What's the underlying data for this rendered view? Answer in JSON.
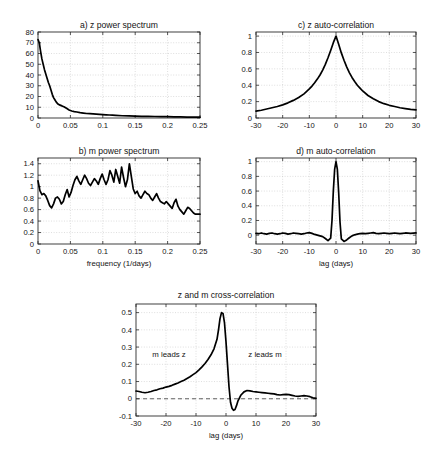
{
  "figure": {
    "panels": [
      "a",
      "b",
      "c",
      "d",
      "e"
    ]
  },
  "chart_data": [
    {
      "id": "a",
      "type": "line",
      "title": "a) z power spectrum",
      "xlabel": "",
      "ylabel": "",
      "xlim": [
        0,
        0.25
      ],
      "ylim": [
        0,
        80
      ],
      "xticks": [
        0,
        0.05,
        0.1,
        0.15,
        0.2,
        0.25
      ],
      "xticklabels": [
        "0",
        "0.05",
        "0.1",
        "0.15",
        "0.2",
        "0.25"
      ],
      "yticks": [
        0,
        10,
        20,
        30,
        40,
        50,
        60,
        70,
        80
      ],
      "yticklabels": [
        "0",
        "10",
        "20",
        "30",
        "40",
        "50",
        "60",
        "70",
        "80"
      ],
      "grid": true,
      "x": [
        0,
        0.002,
        0.004,
        0.006,
        0.008,
        0.01,
        0.012,
        0.014,
        0.016,
        0.018,
        0.02,
        0.022,
        0.024,
        0.026,
        0.028,
        0.03,
        0.032,
        0.034,
        0.036,
        0.038,
        0.04,
        0.044,
        0.048,
        0.052,
        0.056,
        0.06,
        0.065,
        0.07,
        0.075,
        0.08,
        0.085,
        0.09,
        0.095,
        0.1,
        0.105,
        0.11,
        0.115,
        0.12,
        0.13,
        0.14,
        0.15,
        0.16,
        0.17,
        0.18,
        0.19,
        0.2,
        0.21,
        0.22,
        0.23,
        0.24,
        0.25
      ],
      "y": [
        73,
        70,
        62,
        55,
        50,
        45,
        41,
        37,
        33,
        30,
        26,
        22,
        19,
        17,
        15,
        13.5,
        12.5,
        12,
        11.5,
        11,
        10.5,
        9,
        7.5,
        6.5,
        6,
        5.6,
        5,
        4.6,
        4.2,
        4.0,
        3.8,
        3.6,
        3.4,
        3.2,
        3.0,
        2.8,
        2.6,
        2.4,
        2.1,
        1.9,
        1.7,
        1.6,
        1.5,
        1.4,
        1.3,
        1.2,
        1.1,
        1.0,
        0.9,
        0.85,
        0.8
      ]
    },
    {
      "id": "b",
      "type": "line",
      "title": "b) m power spectrum",
      "xlabel": "frequency (1/days)",
      "ylabel": "",
      "xlim": [
        0,
        0.25
      ],
      "ylim": [
        0,
        1.5
      ],
      "xticks": [
        0,
        0.05,
        0.1,
        0.15,
        0.2,
        0.25
      ],
      "xticklabels": [
        "0",
        "0.05",
        "0.1",
        "0.15",
        "0.2",
        "0.25"
      ],
      "yticks": [
        0,
        0.2,
        0.4,
        0.6,
        0.8,
        1.0,
        1.2,
        1.4
      ],
      "yticklabels": [
        "0",
        "0.2",
        "0.4",
        "0.6",
        "0.8",
        "1",
        "1.2",
        "1.4"
      ],
      "grid": true,
      "x": [
        0,
        0.003,
        0.006,
        0.009,
        0.012,
        0.015,
        0.018,
        0.021,
        0.024,
        0.027,
        0.03,
        0.033,
        0.036,
        0.039,
        0.042,
        0.045,
        0.048,
        0.051,
        0.054,
        0.057,
        0.06,
        0.063,
        0.066,
        0.069,
        0.072,
        0.075,
        0.078,
        0.081,
        0.084,
        0.087,
        0.09,
        0.093,
        0.096,
        0.099,
        0.102,
        0.105,
        0.108,
        0.111,
        0.114,
        0.117,
        0.12,
        0.123,
        0.126,
        0.129,
        0.132,
        0.135,
        0.138,
        0.141,
        0.144,
        0.147,
        0.15,
        0.153,
        0.156,
        0.159,
        0.162,
        0.165,
        0.168,
        0.171,
        0.174,
        0.177,
        0.18,
        0.183,
        0.186,
        0.189,
        0.192,
        0.195,
        0.198,
        0.201,
        0.204,
        0.207,
        0.21,
        0.213,
        0.216,
        0.219,
        0.222,
        0.225,
        0.228,
        0.231,
        0.234,
        0.237,
        0.24,
        0.243,
        0.246,
        0.25
      ],
      "y": [
        1.1,
        0.93,
        0.86,
        0.88,
        0.84,
        0.76,
        0.67,
        0.63,
        0.7,
        0.8,
        0.82,
        0.78,
        0.7,
        0.74,
        0.86,
        0.95,
        0.82,
        0.9,
        1.02,
        1.12,
        1.18,
        1.1,
        1.04,
        1.12,
        1.2,
        1.14,
        1.06,
        1.02,
        1.08,
        1.14,
        1.1,
        1.04,
        1.14,
        1.22,
        1.12,
        1.04,
        1.12,
        1.28,
        1.2,
        1.08,
        1.3,
        1.18,
        1.06,
        1.34,
        1.16,
        1.0,
        1.12,
        1.4,
        1.18,
        0.96,
        0.88,
        0.92,
        0.84,
        0.8,
        0.86,
        0.92,
        0.88,
        0.86,
        0.8,
        0.76,
        0.82,
        0.88,
        0.8,
        0.74,
        0.72,
        0.7,
        0.74,
        0.7,
        0.66,
        0.62,
        0.72,
        0.78,
        0.66,
        0.6,
        0.56,
        0.52,
        0.58,
        0.64,
        0.62,
        0.58,
        0.54,
        0.52,
        0.52,
        0.52
      ]
    },
    {
      "id": "c",
      "type": "line",
      "title": "c) z auto-correlation",
      "xlabel": "",
      "ylabel": "",
      "xlim": [
        -30,
        30
      ],
      "ylim": [
        0,
        1.05
      ],
      "xticks": [
        -30,
        -20,
        -10,
        0,
        10,
        20,
        30
      ],
      "xticklabels": [
        "-30",
        "-20",
        "-10",
        "0",
        "10",
        "20",
        "30"
      ],
      "yticks": [
        0,
        0.2,
        0.4,
        0.6,
        0.8,
        1.0
      ],
      "yticklabels": [
        "0",
        "0.2",
        "0.4",
        "0.6",
        "0.8",
        "1"
      ],
      "grid": true,
      "x": [
        -30,
        -28,
        -26,
        -24,
        -22,
        -20,
        -18,
        -16,
        -14,
        -12,
        -10,
        -9,
        -8,
        -7,
        -6,
        -5,
        -4,
        -3,
        -2,
        -1,
        0,
        1,
        2,
        3,
        4,
        5,
        6,
        7,
        8,
        9,
        10,
        12,
        14,
        16,
        18,
        20,
        22,
        24,
        26,
        28,
        30
      ],
      "y": [
        0.085,
        0.095,
        0.11,
        0.125,
        0.14,
        0.16,
        0.185,
        0.215,
        0.25,
        0.295,
        0.355,
        0.39,
        0.43,
        0.475,
        0.525,
        0.585,
        0.655,
        0.735,
        0.825,
        0.92,
        1.0,
        0.9,
        0.795,
        0.705,
        0.625,
        0.555,
        0.495,
        0.445,
        0.4,
        0.365,
        0.33,
        0.275,
        0.235,
        0.2,
        0.175,
        0.155,
        0.14,
        0.125,
        0.115,
        0.105,
        0.1
      ]
    },
    {
      "id": "d",
      "type": "line",
      "title": "d) m auto-correlation",
      "xlabel": "lag (days)",
      "ylabel": "",
      "xlim": [
        -30,
        30
      ],
      "ylim": [
        -0.12,
        1.05
      ],
      "xticks": [
        -30,
        -20,
        -10,
        0,
        10,
        20,
        30
      ],
      "xticklabels": [
        "-30",
        "-20",
        "-10",
        "0",
        "10",
        "20",
        "30"
      ],
      "yticks": [
        0,
        0.2,
        0.4,
        0.6,
        0.8,
        1.0
      ],
      "yticklabels": [
        "0",
        "0.2",
        "0.4",
        "0.6",
        "0.8",
        "1"
      ],
      "grid": true,
      "x": [
        -30,
        -29,
        -28,
        -27,
        -26,
        -25,
        -24,
        -23,
        -22,
        -21,
        -20,
        -19,
        -18,
        -17,
        -16,
        -15,
        -14,
        -13,
        -12,
        -11,
        -10,
        -9,
        -8,
        -7,
        -6,
        -5,
        -4,
        -3,
        -2,
        -1.5,
        -1,
        -0.5,
        0,
        0.5,
        1,
        1.5,
        2,
        3,
        4,
        5,
        6,
        7,
        8,
        9,
        10,
        11,
        12,
        13,
        14,
        15,
        16,
        17,
        18,
        19,
        20,
        21,
        22,
        23,
        24,
        25,
        26,
        27,
        28,
        29,
        30
      ],
      "y": [
        0.025,
        0.02,
        0.03,
        0.02,
        0.015,
        0.025,
        0.03,
        0.02,
        0.015,
        0.02,
        0.03,
        0.025,
        0.015,
        0.02,
        0.03,
        0.025,
        0.02,
        0.015,
        0.02,
        0.03,
        0.035,
        0.025,
        0.01,
        0.0,
        -0.01,
        -0.02,
        -0.045,
        -0.075,
        -0.04,
        0.2,
        0.6,
        0.9,
        1.0,
        0.9,
        0.58,
        0.18,
        -0.05,
        -0.085,
        -0.065,
        -0.035,
        -0.01,
        0.005,
        0.015,
        0.02,
        0.025,
        0.02,
        0.025,
        0.03,
        0.035,
        0.025,
        0.02,
        0.025,
        0.03,
        0.025,
        0.02,
        0.025,
        0.03,
        0.025,
        0.02,
        0.025,
        0.03,
        0.028,
        0.025,
        0.028,
        0.03
      ]
    },
    {
      "id": "e",
      "type": "line",
      "title": "z and m cross-correlation",
      "xlabel": "lag (days)",
      "ylabel": "",
      "xlim": [
        -30,
        30
      ],
      "ylim": [
        -0.1,
        0.55
      ],
      "xticks": [
        -30,
        -20,
        -10,
        0,
        10,
        20,
        30
      ],
      "xticklabels": [
        "-30",
        "-20",
        "-10",
        "0",
        "10",
        "20",
        "30"
      ],
      "yticks": [
        -0.1,
        0,
        0.1,
        0.2,
        0.3,
        0.4,
        0.5
      ],
      "yticklabels": [
        "-0.1",
        "0",
        "0.1",
        "0.2",
        "0.3",
        "0.4",
        "0.5"
      ],
      "grid": true,
      "zeroline": 0,
      "annotations": [
        {
          "text": "m leads z",
          "x": -19,
          "y": 0.245
        },
        {
          "text": "z leads m",
          "x": 13,
          "y": 0.245
        }
      ],
      "x": [
        -30,
        -29,
        -28,
        -27,
        -26,
        -25,
        -24,
        -23,
        -22,
        -21,
        -20,
        -19,
        -18,
        -17,
        -16,
        -15,
        -14,
        -13,
        -12,
        -11,
        -10,
        -9,
        -8,
        -7,
        -6,
        -5,
        -4,
        -3,
        -2.5,
        -2,
        -1.5,
        -1,
        -0.5,
        0,
        0.5,
        1,
        1.5,
        2,
        2.5,
        3,
        3.5,
        4,
        5,
        6,
        7,
        8,
        9,
        10,
        11,
        12,
        13,
        14,
        15,
        16,
        17,
        18,
        19,
        20,
        21,
        22,
        23,
        24,
        25,
        26,
        27,
        28,
        29,
        30
      ],
      "y": [
        0.045,
        0.042,
        0.038,
        0.035,
        0.038,
        0.042,
        0.048,
        0.052,
        0.058,
        0.062,
        0.068,
        0.072,
        0.078,
        0.085,
        0.092,
        0.1,
        0.108,
        0.118,
        0.128,
        0.14,
        0.152,
        0.168,
        0.185,
        0.205,
        0.228,
        0.255,
        0.29,
        0.345,
        0.4,
        0.465,
        0.5,
        0.495,
        0.44,
        0.33,
        0.2,
        0.07,
        -0.02,
        -0.055,
        -0.067,
        -0.062,
        -0.04,
        -0.012,
        0.022,
        0.04,
        0.048,
        0.046,
        0.042,
        0.04,
        0.038,
        0.036,
        0.034,
        0.032,
        0.03,
        0.028,
        0.024,
        0.022,
        0.024,
        0.026,
        0.024,
        0.02,
        0.016,
        0.014,
        0.016,
        0.018,
        0.016,
        0.012,
        0.006,
        0.002
      ]
    }
  ]
}
